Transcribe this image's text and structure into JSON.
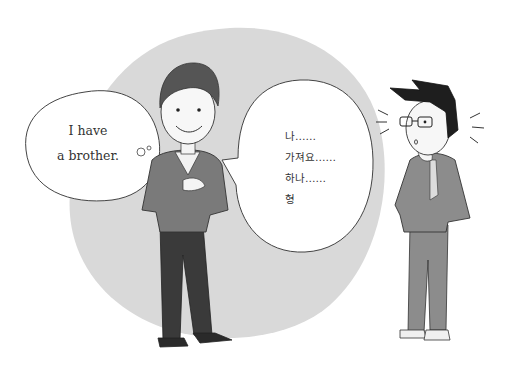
{
  "illustration": {
    "description": "Cartoon: a smiling man thinks in English and speaks broken Korean to a puzzled man in glasses",
    "colors": {
      "background": "#ffffff",
      "backdrop_circle": "#d9d9d9",
      "sweater": "#7a7a7a",
      "pants": "#3a3a3a",
      "hair": "#555555",
      "suit": "#8c8c8c",
      "dark_hair": "#1e1e1e",
      "line": "#333333"
    }
  },
  "thought_bubble": {
    "lines": [
      "I have",
      "a brother."
    ]
  },
  "speech_bubble": {
    "lines": [
      "나……",
      "가져요……",
      "하나……",
      "형"
    ]
  },
  "characters": [
    {
      "name": "smiling-man",
      "pose": "hand on chest, other hand in pocket"
    },
    {
      "name": "puzzled-man",
      "pose": "hand on chin, wearing glasses and suit"
    }
  ]
}
